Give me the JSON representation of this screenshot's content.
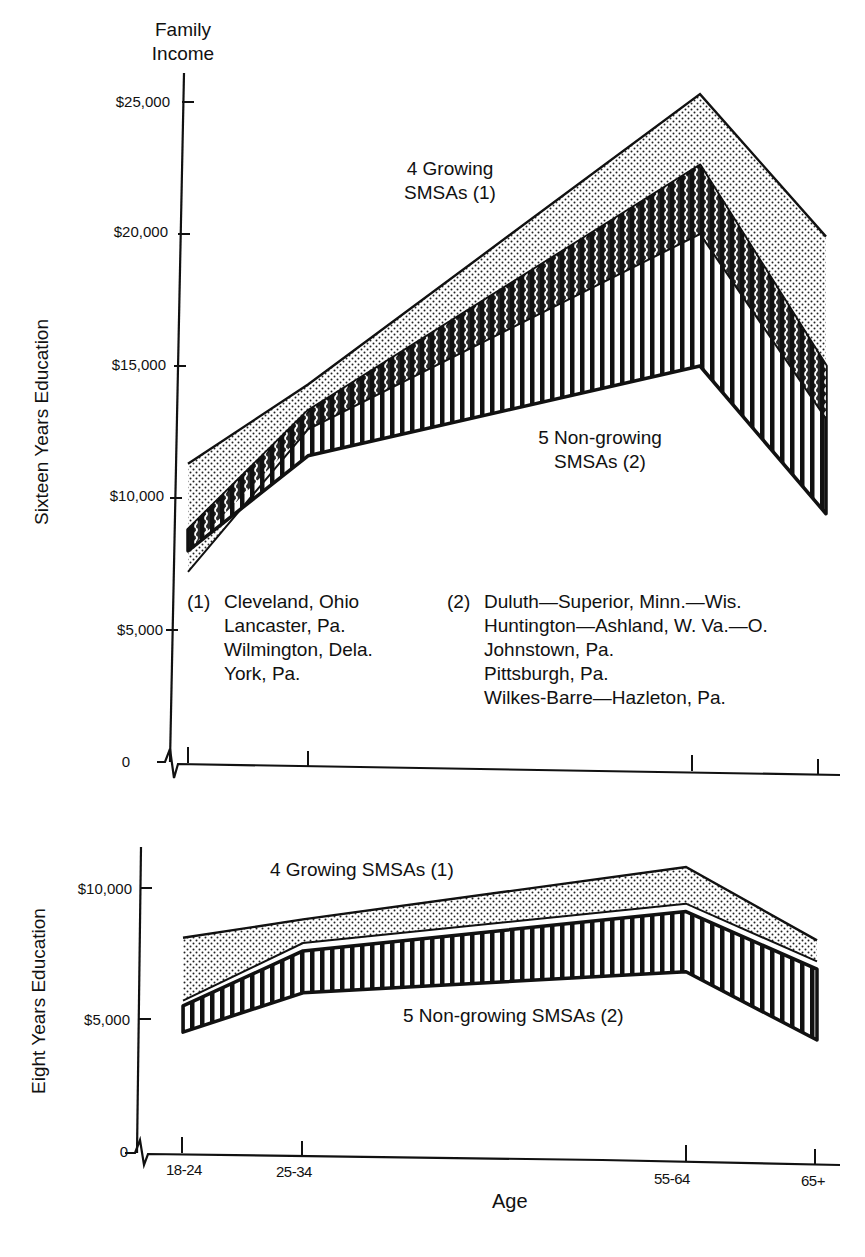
{
  "header": {
    "y_title_line1": "Family",
    "y_title_line2": "Income"
  },
  "upper": {
    "side_label": "Sixteen Years Education",
    "ticks": [
      "$25,000",
      "$20,000",
      "$15,000",
      "$10,000",
      "$5,000",
      "0"
    ],
    "growing_label_line1": "4 Growing",
    "growing_label_line2": "SMSAs (1)",
    "nongrowing_label_line1": "5 Non-growing",
    "nongrowing_label_line2": "SMSAs (2)",
    "notes": {
      "group1": {
        "marker": "(1)",
        "lines": [
          "Cleveland, Ohio",
          "Lancaster, Pa.",
          "Wilmington, Dela.",
          "York, Pa."
        ]
      },
      "group2": {
        "marker": "(2)",
        "lines": [
          "Duluth—Superior, Minn.—Wis.",
          "Huntington—Ashland, W. Va.—O.",
          "Johnstown, Pa.",
          "Pittsburgh, Pa.",
          "Wilkes-Barre—Hazleton, Pa."
        ]
      }
    }
  },
  "lower": {
    "side_label": "Eight Years Education",
    "ticks": [
      "$10,000",
      "$5,000",
      "0"
    ],
    "growing_label": "4 Growing SMSAs (1)",
    "nongrowing_label": "5 Non-growing SMSAs (2)"
  },
  "xaxis": {
    "title": "Age",
    "categories": [
      "18-24",
      "25-34",
      "55-64",
      "65+"
    ]
  },
  "chart_data": [
    {
      "type": "area",
      "title": "Sixteen Years Education",
      "ylabel": "Family Income",
      "xlabel": "Age",
      "categories": [
        "18-24",
        "25-34",
        "55-64",
        "65+"
      ],
      "ylim": [
        0,
        25000
      ],
      "yticks": [
        0,
        5000,
        10000,
        15000,
        20000,
        25000
      ],
      "grid": false,
      "series": [
        {
          "name": "4 Growing SMSAs (1)",
          "pattern": "dotted",
          "upper": [
            11300,
            14300,
            25300,
            19900
          ],
          "lower": [
            7200,
            12600,
            20000,
            13000
          ]
        },
        {
          "name": "5 Non-growing SMSAs (2)",
          "pattern": "vertical-stripes",
          "upper": [
            8800,
            13300,
            22600,
            15000
          ],
          "lower": [
            8000,
            11600,
            15000,
            9400
          ]
        }
      ],
      "annotations": [
        "(1) Cleveland, Ohio; Lancaster, Pa.; Wilmington, Dela.; York, Pa.",
        "(2) Duluth-Superior, Minn.-Wis.; Huntington-Ashland, W. Va.-O.; Johnstown, Pa.; Pittsburgh, Pa.; Wilkes-Barre-Hazleton, Pa."
      ]
    },
    {
      "type": "area",
      "title": "Eight Years Education",
      "ylabel": "Family Income",
      "xlabel": "Age",
      "categories": [
        "18-24",
        "25-34",
        "55-64",
        "65+"
      ],
      "ylim": [
        0,
        11000
      ],
      "yticks": [
        0,
        5000,
        10000
      ],
      "grid": false,
      "series": [
        {
          "name": "4 Growing SMSAs (1)",
          "pattern": "dotted",
          "upper": [
            8100,
            8800,
            10800,
            8000
          ],
          "lower": [
            5700,
            7900,
            9400,
            7200
          ]
        },
        {
          "name": "5 Non-growing SMSAs (2)",
          "pattern": "vertical-stripes",
          "upper": [
            5500,
            7600,
            9100,
            6900
          ],
          "lower": [
            4500,
            6000,
            6800,
            4200
          ]
        }
      ]
    }
  ]
}
